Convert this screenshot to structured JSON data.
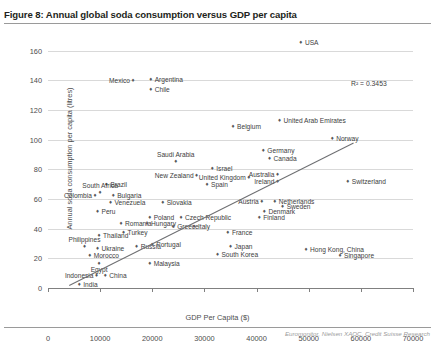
{
  "figure": {
    "label": "Figure 8:",
    "title": "Figure 8: Annual global soda consumption versus GDP per capita",
    "source": "Euromonitor, Nielsen XAOC, Credit Suisse Research",
    "r2_annotation": "R² = 0.3453"
  },
  "chart_data": {
    "type": "scatter",
    "title": "Annual global soda consumption versus GDP per capita",
    "xlabel": "GDP Per Capita ($)",
    "ylabel": "Annual soda consumption per capita (litres)",
    "xlim": [
      0,
      70000
    ],
    "ylim": [
      0,
      170
    ],
    "xticks": [
      0,
      10000,
      20000,
      30000,
      40000,
      50000,
      60000,
      70000
    ],
    "yticks": [
      0,
      20,
      40,
      60,
      80,
      100,
      120,
      140,
      160
    ],
    "grid": "horizontal",
    "legend": "none",
    "r_squared": 0.3453,
    "trendline": {
      "x0": 4000,
      "y0": 2,
      "x1": 58500,
      "y1": 98
    },
    "points": [
      {
        "name": "USA",
        "x": 48500,
        "y": 166,
        "lx": "right"
      },
      {
        "name": "Mexico",
        "x": 16300,
        "y": 140,
        "lx": "left"
      },
      {
        "name": "Argentina",
        "x": 19700,
        "y": 141,
        "lx": "right"
      },
      {
        "name": "Chile",
        "x": 19700,
        "y": 134,
        "lx": "right"
      },
      {
        "name": "United Arab Emirates",
        "x": 44400,
        "y": 113,
        "lx": "right"
      },
      {
        "name": "Belgium",
        "x": 35500,
        "y": 109,
        "lx": "right"
      },
      {
        "name": "Norway",
        "x": 54500,
        "y": 101,
        "lx": "right"
      },
      {
        "name": "Germany",
        "x": 41300,
        "y": 93,
        "lx": "right"
      },
      {
        "name": "Canada",
        "x": 42500,
        "y": 88,
        "lx": "right"
      },
      {
        "name": "Saudi Arabia",
        "x": 24500,
        "y": 86,
        "lx": "above"
      },
      {
        "name": "Israel",
        "x": 31500,
        "y": 81,
        "lx": "right"
      },
      {
        "name": "New Zealand",
        "x": 28500,
        "y": 76,
        "lx": "left"
      },
      {
        "name": "United Kingdom",
        "x": 38500,
        "y": 75,
        "lx": "left"
      },
      {
        "name": "Australia",
        "x": 44000,
        "y": 77,
        "lx": "left"
      },
      {
        "name": "Ireland",
        "x": 44000,
        "y": 72,
        "lx": "left"
      },
      {
        "name": "Spain",
        "x": 30500,
        "y": 70,
        "lx": "right"
      },
      {
        "name": "Switzerland",
        "x": 57500,
        "y": 72,
        "lx": "right"
      },
      {
        "name": "Brazil",
        "x": 11200,
        "y": 70,
        "lx": "right"
      },
      {
        "name": "South Africa",
        "x": 10000,
        "y": 65,
        "lx": "above"
      },
      {
        "name": "Colombia",
        "x": 9000,
        "y": 63,
        "lx": "left"
      },
      {
        "name": "Bulgaria",
        "x": 12500,
        "y": 63,
        "lx": "right"
      },
      {
        "name": "Venezuela",
        "x": 12000,
        "y": 58,
        "lx": "right"
      },
      {
        "name": "Slovakia",
        "x": 22000,
        "y": 58,
        "lx": "right"
      },
      {
        "name": "Austria",
        "x": 41000,
        "y": 59,
        "lx": "left"
      },
      {
        "name": "Netherlands",
        "x": 43500,
        "y": 59,
        "lx": "right"
      },
      {
        "name": "Sweden",
        "x": 45000,
        "y": 55,
        "lx": "right"
      },
      {
        "name": "Denmark",
        "x": 41500,
        "y": 52,
        "lx": "right"
      },
      {
        "name": "Finland",
        "x": 40500,
        "y": 48,
        "lx": "right"
      },
      {
        "name": "Peru",
        "x": 9500,
        "y": 52,
        "lx": "right"
      },
      {
        "name": "Poland",
        "x": 19500,
        "y": 48,
        "lx": "right"
      },
      {
        "name": "Czech Republic",
        "x": 25500,
        "y": 48,
        "lx": "right"
      },
      {
        "name": "Romania",
        "x": 14000,
        "y": 44,
        "lx": "right"
      },
      {
        "name": "Hungary",
        "x": 19000,
        "y": 44,
        "lx": "right"
      },
      {
        "name": "Greece",
        "x": 24000,
        "y": 42,
        "lx": "right"
      },
      {
        "name": "Italy",
        "x": 28000,
        "y": 42,
        "lx": "right"
      },
      {
        "name": "France",
        "x": 34500,
        "y": 38,
        "lx": "right"
      },
      {
        "name": "Turkey",
        "x": 14500,
        "y": 38,
        "lx": "right"
      },
      {
        "name": "Thailand",
        "x": 9800,
        "y": 36,
        "lx": "right"
      },
      {
        "name": "Portugal",
        "x": 20000,
        "y": 30,
        "lx": "right"
      },
      {
        "name": "Russia",
        "x": 17000,
        "y": 28,
        "lx": "right"
      },
      {
        "name": "Japan",
        "x": 35000,
        "y": 28,
        "lx": "right"
      },
      {
        "name": "Hong Kong, China",
        "x": 49500,
        "y": 26,
        "lx": "right"
      },
      {
        "name": "South Korea",
        "x": 32500,
        "y": 23,
        "lx": "right"
      },
      {
        "name": "Singapore",
        "x": 56000,
        "y": 22,
        "lx": "right"
      },
      {
        "name": "Philippines",
        "x": 7000,
        "y": 28,
        "lx": "above"
      },
      {
        "name": "Ukraine",
        "x": 9500,
        "y": 27,
        "lx": "right"
      },
      {
        "name": "Morocco",
        "x": 8000,
        "y": 22,
        "lx": "right"
      },
      {
        "name": "Egypt",
        "x": 9800,
        "y": 17,
        "lx": "below"
      },
      {
        "name": "Malaysia",
        "x": 19500,
        "y": 17,
        "lx": "right"
      },
      {
        "name": "Indonesia",
        "x": 9300,
        "y": 9,
        "lx": "left"
      },
      {
        "name": "China",
        "x": 11000,
        "y": 9,
        "lx": "right"
      },
      {
        "name": "India",
        "x": 6000,
        "y": 3,
        "lx": "right"
      }
    ]
  }
}
